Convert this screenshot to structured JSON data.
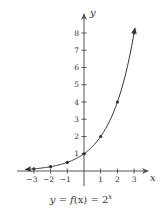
{
  "chart_data": {
    "type": "line",
    "xlabel": "x",
    "ylabel": "y",
    "xlim": [
      -3.9,
      3.8
    ],
    "ylim": [
      -0.7,
      9.3
    ],
    "x_ticks": [
      -3,
      -2,
      -1,
      1,
      2,
      3
    ],
    "y_ticks": [
      1,
      2,
      3,
      4,
      5,
      6,
      7,
      8
    ],
    "grid": false,
    "legend": null,
    "series": [
      {
        "name": "f(x) = 2^x",
        "function": "2^x",
        "points": [
          {
            "x": -3,
            "y": 0.125
          },
          {
            "x": -2,
            "y": 0.25
          },
          {
            "x": -1,
            "y": 0.5
          },
          {
            "x": 0,
            "y": 1
          },
          {
            "x": 1,
            "y": 2
          },
          {
            "x": 2,
            "y": 4
          },
          {
            "x": 3,
            "y": 8
          }
        ],
        "arrows_at_ends": true
      }
    ],
    "colors": {
      "axis": "#555555",
      "curve": "#333333",
      "text": "#333333"
    }
  },
  "caption": {
    "lhs": "y",
    "eq1": " = ",
    "fn": "f",
    "arg": "(x)",
    "eq2": " = 2",
    "exp": "x"
  }
}
